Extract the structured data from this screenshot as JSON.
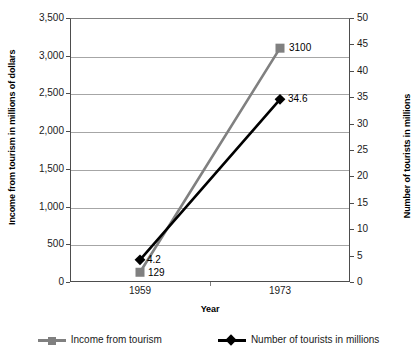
{
  "chart_data": {
    "type": "line",
    "title": "",
    "xlabel": "Year",
    "categories": [
      "1959",
      "1973"
    ],
    "x": [
      1959,
      1973
    ],
    "grid": "horizontal",
    "legend_position": "bottom",
    "axes": {
      "left": {
        "label": "Income from tourism in millions of dollars",
        "min": 0,
        "max": 3500,
        "step": 500,
        "ticks": [
          "0",
          "500",
          "1,000",
          "1,500",
          "2,000",
          "2,500",
          "3,000",
          "3,500"
        ],
        "tick_values": [
          0,
          500,
          1000,
          1500,
          2000,
          2500,
          3000,
          3500
        ]
      },
      "right": {
        "label": "Number of tourists in millions",
        "min": 0,
        "max": 50,
        "step": 5,
        "ticks": [
          "0",
          "5",
          "10",
          "15",
          "20",
          "25",
          "30",
          "35",
          "40",
          "45",
          "50"
        ],
        "tick_values": [
          0,
          5,
          10,
          15,
          20,
          25,
          30,
          35,
          40,
          45,
          50
        ]
      }
    },
    "series": [
      {
        "name": "Income from tourism",
        "axis": "left",
        "color": "#808080",
        "marker": "square",
        "values": [
          129,
          3100
        ],
        "data_labels": [
          "129",
          "3100"
        ]
      },
      {
        "name": "Number of tourists in millions",
        "axis": "right",
        "color": "#000000",
        "marker": "diamond",
        "values": [
          4.2,
          34.6
        ],
        "data_labels": [
          "4.2",
          "34.6"
        ]
      }
    ]
  },
  "legend": {
    "items": [
      {
        "label": "Income from tourism",
        "color": "#808080",
        "marker": "square"
      },
      {
        "label": "Number of tourists in millions",
        "color": "#000000",
        "marker": "diamond"
      }
    ]
  },
  "colors": {
    "income": "#808080",
    "tourists": "#000000",
    "gridline": "#a6a6a6",
    "axis": "#4d4d4d",
    "background": "#ffffff"
  }
}
